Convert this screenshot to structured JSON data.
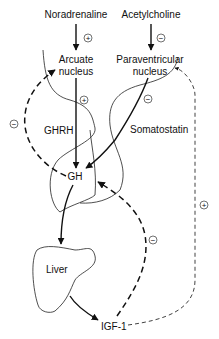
{
  "diagram": {
    "nodes": {
      "noradrenaline": "Noradrenaline",
      "acetylcholine": "Acetylcholine",
      "arcuate_line1": "Arcuate",
      "arcuate_line2": "nucleus",
      "paraventricular_line1": "Paraventricular",
      "paraventricular_line2": "nucleus",
      "ghrh": "GHRH",
      "somatostatin": "Somatostatin",
      "gh": "GH",
      "liver": "Liver",
      "igf1": "IGF-1"
    },
    "signs": {
      "noradrenaline_to_arcuate": "+",
      "acetylcholine_to_paraventricular": "−",
      "arcuate_to_gh": "+",
      "paraventricular_to_gh": "−",
      "gh_feedback_to_arcuate": "−",
      "igf1_feedback_to_gh": "−",
      "igf1_feedback_to_paraventricular": "+"
    },
    "edges": [
      {
        "from": "Noradrenaline",
        "to": "Arcuate nucleus",
        "sign": "+",
        "style": "solid"
      },
      {
        "from": "Acetylcholine",
        "to": "Paraventricular nucleus",
        "sign": "−",
        "style": "solid"
      },
      {
        "from": "Arcuate nucleus",
        "to": "GH",
        "sign": "+",
        "style": "solid",
        "label": "GHRH"
      },
      {
        "from": "Paraventricular nucleus",
        "to": "GH",
        "sign": "−",
        "style": "solid",
        "label": "Somatostatin"
      },
      {
        "from": "GH",
        "to": "Arcuate nucleus",
        "sign": "−",
        "style": "thick-dashed"
      },
      {
        "from": "GH",
        "to": "Liver",
        "style": "solid"
      },
      {
        "from": "Liver",
        "to": "IGF-1",
        "style": "solid"
      },
      {
        "from": "IGF-1",
        "to": "GH",
        "sign": "−",
        "style": "thick-dashed"
      },
      {
        "from": "IGF-1",
        "to": "Paraventricular nucleus",
        "sign": "+",
        "style": "thin-dashed"
      }
    ]
  }
}
